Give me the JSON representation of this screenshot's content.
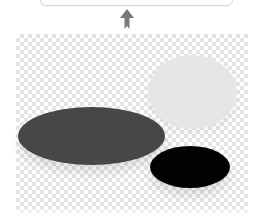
{
  "diagram": {
    "top_box": {
      "kind": "rounded-panel-bottom-edge",
      "border_color": "#d6d6d6"
    },
    "connector": {
      "icon": "arrow-up-icon",
      "color": "#7a7a7a",
      "direction": "up"
    },
    "canvas": {
      "background": "transparency-checkerboard",
      "checker_color": "#e4e4e4"
    },
    "shapes": [
      {
        "name": "light-gray-ellipse",
        "fill": "#e6e6e6"
      },
      {
        "name": "dark-gray-ellipse",
        "fill": "#474747"
      },
      {
        "name": "black-ellipse",
        "fill": "#030303"
      }
    ]
  }
}
